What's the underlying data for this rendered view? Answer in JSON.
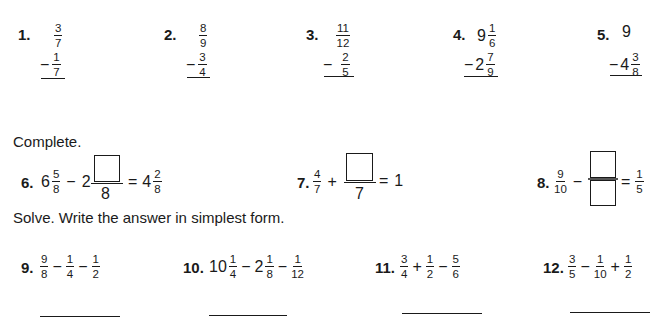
{
  "section1": {
    "problems": [
      {
        "number": "1.",
        "top": {
          "n": "3",
          "d": "7"
        },
        "operator": "−",
        "bottom": {
          "n": "1",
          "d": "7"
        }
      },
      {
        "number": "2.",
        "top": {
          "n": "8",
          "d": "9"
        },
        "operator": "−",
        "bottom": {
          "n": "3",
          "d": "4"
        }
      },
      {
        "number": "3.",
        "top": {
          "n": "11",
          "d": "12"
        },
        "operator": "−",
        "bottom": {
          "n": "2",
          "d": "5"
        }
      },
      {
        "number": "4.",
        "top": {
          "whole": "9",
          "n": "1",
          "d": "6"
        },
        "operator": "−",
        "bottom": {
          "whole": "2",
          "n": "7",
          "d": "9"
        }
      },
      {
        "number": "5.",
        "top": {
          "whole": "9"
        },
        "operator": "−",
        "bottom": {
          "whole": "4",
          "n": "3",
          "d": "8"
        }
      }
    ]
  },
  "section2": {
    "instruction": "Complete.",
    "problems": [
      {
        "number": "6.",
        "a_whole": "6",
        "a_n": "5",
        "a_d": "8",
        "op": "−",
        "b_whole": "2",
        "b_d": "8",
        "eq": "=",
        "r_whole": "4",
        "r_n": "2",
        "r_d": "8"
      },
      {
        "number": "7.",
        "a_n": "4",
        "a_d": "7",
        "op": "+",
        "b_d": "7",
        "eq": "=",
        "result": "1"
      },
      {
        "number": "8.",
        "a_n": "9",
        "a_d": "10",
        "op": "−",
        "eq": "=",
        "r_n": "1",
        "r_d": "5"
      }
    ]
  },
  "section3": {
    "instruction": "Solve. Write the answer in simplest form.",
    "problems": [
      {
        "number": "9.",
        "terms": [
          {
            "n": "9",
            "d": "8"
          },
          {
            "op": "−",
            "n": "1",
            "d": "4"
          },
          {
            "op": "−",
            "n": "1",
            "d": "2"
          }
        ]
      },
      {
        "number": "10.",
        "terms": [
          {
            "whole": "10",
            "n": "1",
            "d": "4"
          },
          {
            "op": "−",
            "whole": "2",
            "n": "1",
            "d": "8"
          },
          {
            "op": "−",
            "n": "1",
            "d": "12"
          }
        ]
      },
      {
        "number": "11.",
        "terms": [
          {
            "n": "3",
            "d": "4"
          },
          {
            "op": "+",
            "n": "1",
            "d": "2"
          },
          {
            "op": "−",
            "n": "5",
            "d": "6"
          }
        ]
      },
      {
        "number": "12.",
        "terms": [
          {
            "n": "3",
            "d": "5"
          },
          {
            "op": "−",
            "n": "1",
            "d": "10"
          },
          {
            "op": "+",
            "n": "1",
            "d": "2"
          }
        ]
      }
    ]
  }
}
